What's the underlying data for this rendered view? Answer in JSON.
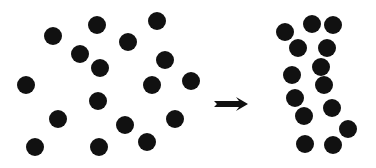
{
  "diagram": {
    "dot_color": "#111111",
    "dot_radius": 9,
    "left_panel": {
      "label": "scattered-state",
      "dots": [
        [
          53,
          36
        ],
        [
          97,
          25
        ],
        [
          157,
          21
        ],
        [
          80,
          54
        ],
        [
          128,
          42
        ],
        [
          100,
          68
        ],
        [
          165,
          60
        ],
        [
          26,
          85
        ],
        [
          152,
          85
        ],
        [
          191,
          81
        ],
        [
          98,
          101
        ],
        [
          58,
          119
        ],
        [
          125,
          125
        ],
        [
          175,
          119
        ],
        [
          35,
          147
        ],
        [
          99,
          147
        ],
        [
          147,
          142
        ]
      ]
    },
    "arrow": {
      "x1": 214,
      "x2": 248,
      "y": 104,
      "color": "#111111"
    },
    "right_panel": {
      "label": "clustered-state",
      "dots": [
        [
          285,
          32
        ],
        [
          312,
          24
        ],
        [
          333,
          25
        ],
        [
          298,
          48
        ],
        [
          327,
          48
        ],
        [
          321,
          67
        ],
        [
          292,
          75
        ],
        [
          324,
          85
        ],
        [
          295,
          98
        ],
        [
          332,
          108
        ],
        [
          304,
          116
        ],
        [
          348,
          129
        ],
        [
          305,
          144
        ],
        [
          333,
          145
        ]
      ]
    }
  }
}
